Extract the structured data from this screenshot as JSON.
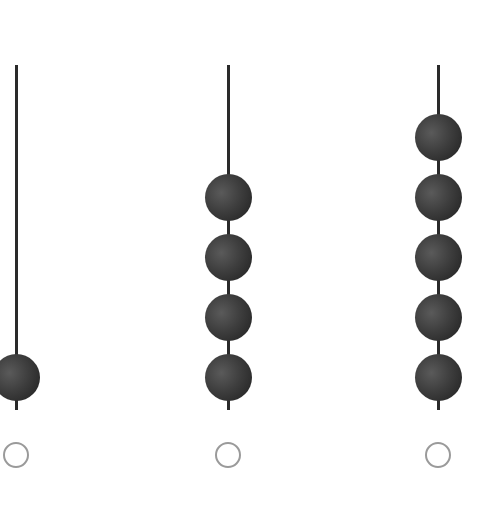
{
  "diagram": {
    "type": "abacus",
    "rod_top_y": 65,
    "rod_bottom_y": 410,
    "bead_spacing": 60,
    "bottom_bead_center_y": 377,
    "colors": {
      "rod": "#2a2a2a",
      "bead": "#3a3a3a",
      "circle_border": "#9a9a9a"
    },
    "columns": [
      {
        "x": 16,
        "beads": 1,
        "circle_selected": false
      },
      {
        "x": 228,
        "beads": 4,
        "circle_selected": false
      },
      {
        "x": 438,
        "beads": 5,
        "circle_selected": false
      }
    ]
  }
}
